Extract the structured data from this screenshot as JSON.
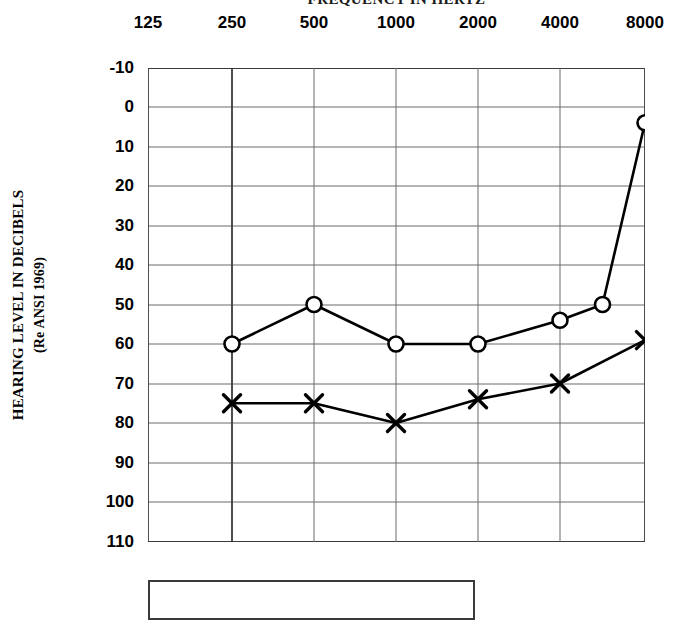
{
  "chart_data": {
    "type": "line",
    "title": "FREQUENCY IN HERTZ",
    "xlabel": "FREQUENCY IN HERTZ",
    "ylabel": "HEARING LEVEL IN DECIBELS",
    "ylabel_line2": "(Re ANSI 1969)",
    "x_tick_labels": [
      "125",
      "250",
      "500",
      "1000",
      "2000",
      "4000",
      "8000"
    ],
    "y_tick_labels": [
      "-10",
      "0",
      "10",
      "20",
      "30",
      "40",
      "50",
      "60",
      "70",
      "80",
      "90",
      "100",
      "110"
    ],
    "ylim": [
      -10,
      110
    ],
    "y_inverted": true,
    "grid": true,
    "legend_position": "below-plot",
    "series": [
      {
        "name": "right-ear-air-conduction",
        "marker": "circle",
        "x": [
          "250",
          "500",
          "1000",
          "2000",
          "4000",
          "6000",
          "8000"
        ],
        "values": [
          60,
          50,
          60,
          60,
          54,
          50,
          4
        ]
      },
      {
        "name": "left-ear-air-conduction",
        "marker": "x",
        "x": [
          "250",
          "500",
          "1000",
          "2000",
          "4000",
          "8000"
        ],
        "values": [
          75,
          75,
          80,
          74,
          70,
          59
        ]
      }
    ]
  },
  "axes": {
    "x_ticks": [
      {
        "label": "125",
        "px": 148
      },
      {
        "label": "250",
        "px": 232
      },
      {
        "label": "500",
        "px": 314
      },
      {
        "label": "1000",
        "px": 396
      },
      {
        "label": "2000",
        "px": 478
      },
      {
        "label": "4000",
        "px": 560
      },
      {
        "label": "8000",
        "px": 645
      }
    ],
    "y_ticks": [
      {
        "label": "-10",
        "px": 68
      },
      {
        "label": "0",
        "px": 107
      },
      {
        "label": "10",
        "px": 147
      },
      {
        "label": "20",
        "px": 186
      },
      {
        "label": "30",
        "px": 226
      },
      {
        "label": "40",
        "px": 265
      },
      {
        "label": "50",
        "px": 305
      },
      {
        "label": "60",
        "px": 344
      },
      {
        "label": "70",
        "px": 384
      },
      {
        "label": "80",
        "px": 423
      },
      {
        "label": "90",
        "px": 463
      },
      {
        "label": "100",
        "px": 502
      },
      {
        "label": "110",
        "px": 542
      }
    ]
  },
  "colors": {
    "ink": "#000000",
    "grid": "#6b6b6b",
    "border": "#3a3a3a",
    "background": "#ffffff"
  }
}
